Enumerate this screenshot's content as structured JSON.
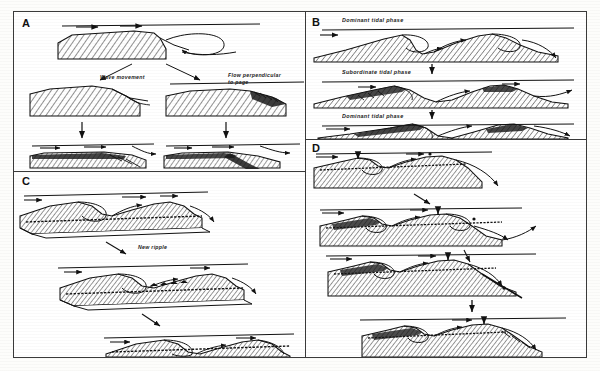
{
  "figure": {
    "background_color": "#fdfdfb",
    "ink_color": "#111111",
    "frame_color": "#3a3a3a",
    "hatch_color": "#2b2b2b",
    "width": 600,
    "height": 371
  },
  "panels": [
    {
      "id": "A",
      "letter": "A",
      "name": "panel-a",
      "labels": [
        {
          "id": "wave-movement",
          "text": "Wave movement"
        },
        {
          "id": "flow-perpendicular",
          "text": "Flow perpendicular",
          "text2": "to page"
        }
      ],
      "stages": 3
    },
    {
      "id": "B",
      "letter": "B",
      "name": "panel-b",
      "labels": [
        {
          "id": "dominant-tidal-phase-1",
          "text": "Dominant tidal phase"
        },
        {
          "id": "subordinate-tidal-phase",
          "text": "Subordinate tidal phase"
        },
        {
          "id": "dominant-tidal-phase-2",
          "text": "Dominant tidal phase"
        }
      ],
      "stages": 3
    },
    {
      "id": "C",
      "letter": "C",
      "name": "panel-c",
      "labels": [
        {
          "id": "new-ripple",
          "text": "New ripple"
        }
      ],
      "stages": 3
    },
    {
      "id": "D",
      "letter": "D",
      "name": "panel-d",
      "labels": [],
      "stages": 4
    }
  ]
}
